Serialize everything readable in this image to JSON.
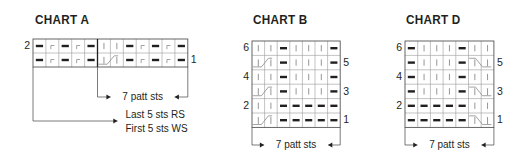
{
  "colors": {
    "ink": "#231f20",
    "grid": "#9a9a9a",
    "light_symbol": "#8a8a8a"
  },
  "legend_symbols": {
    "P": "purl (bold dash)",
    "K": "knit (vertical bar)",
    "T": "twisted / slip stitch (corner)",
    "CL": "2-st cable left (first half)",
    "CL2": "2-st cable left (second half)",
    "CR": "2-st cable right (first half)",
    "CR2": "2-st cable right (second half)"
  },
  "charts": [
    {
      "id": "A",
      "title": "CHART A",
      "x": 33,
      "y": 39,
      "cell_w": 12.9,
      "cell_h": 14,
      "divider_after_col": 5,
      "rows": [
        {
          "num": "2",
          "side": "left",
          "cells": [
            "P",
            "T",
            "P",
            "T",
            "P",
            "K",
            "K",
            "P",
            "T",
            "P",
            "T",
            "P"
          ]
        },
        {
          "num": "1",
          "side": "right",
          "cells": [
            "P",
            "T",
            "P",
            "T",
            "P",
            "CL",
            "CL2",
            "P",
            "T",
            "P",
            "T",
            "P"
          ]
        }
      ],
      "brackets": [
        {
          "label": "7 patt sts",
          "from_col": 5,
          "to_col": 12,
          "y": 97,
          "style": "center"
        },
        {
          "label_lines": [
            "Last 5 sts RS",
            "First 5 sts WS"
          ],
          "from_col": 0,
          "to_col": 5,
          "y": 121,
          "style": "right"
        }
      ]
    },
    {
      "id": "B",
      "title": "CHART B",
      "x": 252,
      "y": 41,
      "cell_w": 12.6,
      "cell_h": 14.4,
      "rows": [
        {
          "num": "6",
          "side": "left",
          "cells": [
            "K",
            "K",
            "P",
            "K",
            "K",
            "K",
            "P"
          ]
        },
        {
          "num": "5",
          "side": "right",
          "cells": [
            "CL",
            "CL2",
            "P",
            "K",
            "K",
            "K",
            "P"
          ]
        },
        {
          "num": "4",
          "side": "left",
          "cells": [
            "K",
            "K",
            "P",
            "K",
            "K",
            "K",
            "P"
          ]
        },
        {
          "num": "3",
          "side": "right",
          "cells": [
            "CL",
            "CL2",
            "P",
            "K",
            "K",
            "K",
            "P"
          ]
        },
        {
          "num": "2",
          "side": "left",
          "cells": [
            "K",
            "K",
            "P",
            "P",
            "P",
            "P",
            "P"
          ]
        },
        {
          "num": "1",
          "side": "right",
          "cells": [
            "CL",
            "CL2",
            "P",
            "P",
            "P",
            "P",
            "P"
          ]
        }
      ],
      "brackets": [
        {
          "label": "7 patt sts",
          "from_col": 0,
          "to_col": 7,
          "y": 145,
          "style": "center"
        }
      ]
    },
    {
      "id": "D",
      "title": "CHART D",
      "x": 405,
      "y": 41,
      "cell_w": 12.7,
      "cell_h": 14.4,
      "rows": [
        {
          "num": "6",
          "side": "left",
          "cells": [
            "P",
            "K",
            "K",
            "K",
            "P",
            "K",
            "K"
          ]
        },
        {
          "num": "5",
          "side": "right",
          "cells": [
            "P",
            "K",
            "K",
            "K",
            "P",
            "CR",
            "CR2"
          ]
        },
        {
          "num": "4",
          "side": "left",
          "cells": [
            "P",
            "K",
            "K",
            "K",
            "P",
            "K",
            "K"
          ]
        },
        {
          "num": "3",
          "side": "right",
          "cells": [
            "P",
            "K",
            "K",
            "K",
            "P",
            "CR",
            "CR2"
          ]
        },
        {
          "num": "2",
          "side": "left",
          "cells": [
            "P",
            "P",
            "P",
            "P",
            "P",
            "K",
            "K"
          ]
        },
        {
          "num": "1",
          "side": "right",
          "cells": [
            "P",
            "P",
            "P",
            "P",
            "P",
            "CR",
            "CR2"
          ]
        }
      ],
      "brackets": [
        {
          "label": "7 patt sts",
          "from_col": 0,
          "to_col": 7,
          "y": 145,
          "style": "center"
        }
      ]
    }
  ],
  "titles": {
    "A": {
      "text": "CHART A",
      "x": 35,
      "y": 12
    },
    "B": {
      "text": "CHART B",
      "x": 253,
      "y": 12
    },
    "D": {
      "text": "CHART D",
      "x": 406,
      "y": 12
    }
  }
}
